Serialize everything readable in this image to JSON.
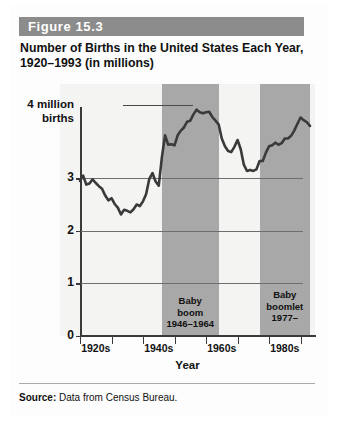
{
  "figure": {
    "number_label": "Figure 15.3",
    "title": "Number of Births in the United States Each Year, 1920–1993 (in millions)",
    "source_prefix": "Source:",
    "source_text": " Data from Census Bureau."
  },
  "colors": {
    "header_bar": "#8c8c8c",
    "band_fill": "#a8a8a8",
    "plot_background": "#f4f4f2",
    "line": "#3a3a3a",
    "axis": "#3a3a3a",
    "gridline": "#6e6e6e"
  },
  "chart_data": {
    "type": "line",
    "title": "Number of Births in the United States Each Year, 1920–1993 (in millions)",
    "xlabel": "Year",
    "ylabel": "4 million births",
    "y_axis_caption_line1": "4 million",
    "y_axis_caption_line2": "births",
    "xlim": [
      1920,
      1993
    ],
    "ylim": [
      0,
      4.6
    ],
    "yticks": [
      0,
      1,
      2,
      3
    ],
    "ytick_labels": [
      "0",
      "1",
      "2",
      "3"
    ],
    "grid": true,
    "grid_axis": "y",
    "legend": "none",
    "xtick_labels": [
      "1920s",
      "1940s",
      "1960s",
      "1980s"
    ],
    "xtick_decades": [
      1920,
      1940,
      1960,
      1980
    ],
    "x": [
      1920,
      1921,
      1922,
      1923,
      1924,
      1925,
      1926,
      1927,
      1928,
      1929,
      1930,
      1931,
      1932,
      1933,
      1934,
      1935,
      1936,
      1937,
      1938,
      1939,
      1940,
      1941,
      1942,
      1943,
      1944,
      1945,
      1946,
      1947,
      1948,
      1949,
      1950,
      1951,
      1952,
      1953,
      1954,
      1955,
      1956,
      1957,
      1958,
      1959,
      1960,
      1961,
      1962,
      1963,
      1964,
      1965,
      1966,
      1967,
      1968,
      1969,
      1970,
      1971,
      1972,
      1973,
      1974,
      1975,
      1976,
      1977,
      1978,
      1979,
      1980,
      1981,
      1982,
      1983,
      1984,
      1985,
      1986,
      1987,
      1988,
      1989,
      1990,
      1991,
      1992,
      1993
    ],
    "values": [
      2.95,
      3.05,
      2.88,
      2.9,
      2.98,
      2.91,
      2.85,
      2.8,
      2.67,
      2.58,
      2.62,
      2.51,
      2.44,
      2.31,
      2.4,
      2.38,
      2.35,
      2.41,
      2.5,
      2.47,
      2.56,
      2.7,
      2.99,
      3.1,
      2.94,
      2.86,
      3.41,
      3.82,
      3.64,
      3.65,
      3.63,
      3.82,
      3.91,
      3.97,
      4.08,
      4.1,
      4.22,
      4.31,
      4.26,
      4.24,
      4.26,
      4.27,
      4.17,
      4.1,
      4.03,
      3.76,
      3.61,
      3.52,
      3.5,
      3.6,
      3.73,
      3.56,
      3.26,
      3.14,
      3.16,
      3.14,
      3.17,
      3.33,
      3.33,
      3.49,
      3.61,
      3.63,
      3.68,
      3.64,
      3.67,
      3.76,
      3.76,
      3.81,
      3.91,
      4.04,
      4.16,
      4.11,
      4.07,
      4.0
    ],
    "annotations": [
      {
        "id": "baby-boom",
        "label_line1": "Baby",
        "label_line2": "boom",
        "label_line3": "1946–1964",
        "start_year": 1946,
        "end_year": 1964,
        "style": "shaded-band"
      },
      {
        "id": "baby-boomlet",
        "label_line1": "Baby",
        "label_line2": "boomlet",
        "label_line3": "1977–",
        "start_year": 1977,
        "end_year": 1993,
        "style": "shaded-band"
      }
    ]
  }
}
